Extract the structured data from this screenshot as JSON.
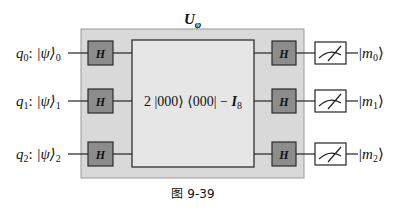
{
  "diagram": {
    "unitary_label": {
      "main": "U",
      "sub": "φ"
    },
    "operator_label": {
      "coeff": "2 |000⟩ ⟨000| − ",
      "ident": "I",
      "ident_sub": "8"
    },
    "gate_label": "H",
    "qubits": [
      {
        "name": "q",
        "index": "0",
        "state": "|ψ⟩",
        "state_sub": "0",
        "output": "|m",
        "output_sub": "0",
        "output_close": "⟩"
      },
      {
        "name": "q",
        "index": "1",
        "state": "|ψ⟩",
        "state_sub": "1",
        "output": "|m",
        "output_sub": "1",
        "output_close": "⟩"
      },
      {
        "name": "q",
        "index": "2",
        "state": "|ψ⟩",
        "state_sub": "2",
        "output": "|m",
        "output_sub": "2",
        "output_close": "⟩"
      }
    ],
    "caption": "图 9-39",
    "colors": {
      "outer_box": "#d9d9d9",
      "inner_box": "#e6e6e6",
      "gate_fill": "#8c8c8c",
      "line": "#222222"
    }
  }
}
